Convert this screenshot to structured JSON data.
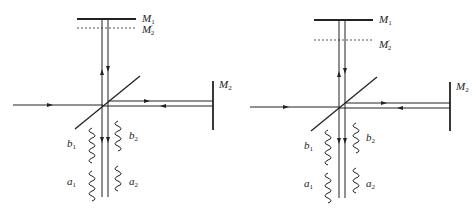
{
  "diagrams": [
    {
      "id": "left",
      "labels": {
        "m1": {
          "base": "M",
          "sub": "1",
          "prime": ""
        },
        "m2p": {
          "base": "M",
          "sub": "2",
          "prime": "′"
        },
        "m2": {
          "base": "M",
          "sub": "2",
          "prime": ""
        },
        "b1": {
          "base": "b",
          "sub": "1"
        },
        "b2": {
          "base": "b",
          "sub": "2"
        },
        "a1": {
          "base": "a",
          "sub": "1"
        },
        "a2": {
          "base": "a",
          "sub": "2"
        }
      },
      "description": "Michelson interferometer, M2' image close to M1"
    },
    {
      "id": "right",
      "labels": {
        "m1": {
          "base": "M",
          "sub": "1",
          "prime": ""
        },
        "m2p": {
          "base": "M",
          "sub": "2",
          "prime": "′"
        },
        "m2": {
          "base": "M",
          "sub": "2",
          "prime": ""
        },
        "b1": {
          "base": "b",
          "sub": "1"
        },
        "b2": {
          "base": "b",
          "sub": "2"
        },
        "a1": {
          "base": "a",
          "sub": "1"
        },
        "a2": {
          "base": "a",
          "sub": "2"
        }
      },
      "description": "Michelson interferometer, M2' image farther from M1"
    }
  ],
  "colors": {
    "line": "#222222",
    "dashed": "#555555"
  }
}
